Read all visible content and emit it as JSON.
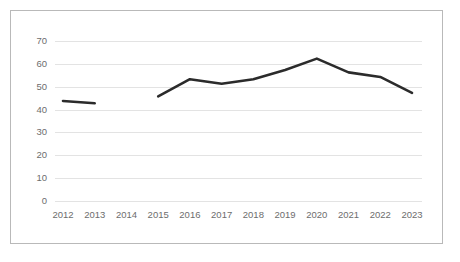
{
  "chart_data": {
    "type": "line",
    "title": "",
    "subtitle": "",
    "xlabel": "",
    "ylabel": "",
    "categories": [
      "2012",
      "2013",
      "2014",
      "2015",
      "2016",
      "2017",
      "2018",
      "2019",
      "2020",
      "2021",
      "2022",
      "2023"
    ],
    "series": [
      {
        "name": "",
        "values": [
          44,
          43,
          null,
          46,
          53.5,
          51.5,
          53.5,
          57.5,
          62.5,
          56.5,
          54.5,
          47.5
        ]
      }
    ],
    "ylim": [
      0,
      70
    ],
    "ytick_labels": [
      "0",
      "10",
      "20",
      "30",
      "40",
      "50",
      "60",
      "70"
    ],
    "ytick_values": [
      0,
      10,
      20,
      30,
      40,
      50,
      60,
      70
    ],
    "grid": true,
    "grid_axis": "y",
    "legend": false,
    "legend_position": "none",
    "annotations": [],
    "colors": {
      "line": "#2b2b2b",
      "gridline": "#e3e3e3",
      "tick_label": "#6d6d6d",
      "border": "#b9b9b9",
      "background": "#ffffff"
    }
  },
  "card": {
    "border_color": "#b9b9b9"
  }
}
